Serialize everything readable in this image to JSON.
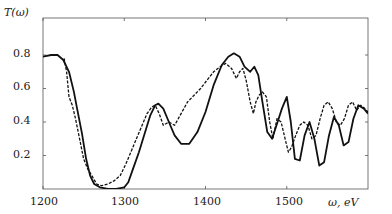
{
  "chart_data": {
    "type": "line",
    "title": "",
    "xlabel": "ω, eV",
    "ylabel": "T(ω)",
    "xlim": [
      1200,
      1600
    ],
    "ylim": [
      0,
      1.02
    ],
    "xticks": [
      1200,
      1300,
      1400,
      1500
    ],
    "yticks": [
      0.2,
      0.4,
      0.6,
      0.8
    ],
    "grid": false,
    "legend": null,
    "series": [
      {
        "name": "solid",
        "style": "solid",
        "x": [
          1200,
          1210,
          1218,
          1225,
          1232,
          1238,
          1242,
          1248,
          1253,
          1258,
          1263,
          1270,
          1280,
          1290,
          1300,
          1305,
          1310,
          1318,
          1325,
          1332,
          1338,
          1342,
          1348,
          1355,
          1362,
          1370,
          1380,
          1390,
          1400,
          1410,
          1420,
          1428,
          1435,
          1442,
          1448,
          1455,
          1460,
          1465,
          1470,
          1476,
          1482,
          1488,
          1494,
          1500,
          1505,
          1510,
          1516,
          1522,
          1528,
          1534,
          1540,
          1546,
          1552,
          1558,
          1564,
          1570,
          1576,
          1582,
          1588,
          1595,
          1600
        ],
        "y": [
          0.79,
          0.8,
          0.8,
          0.77,
          0.7,
          0.58,
          0.48,
          0.33,
          0.18,
          0.08,
          0.03,
          0.01,
          0.0,
          0.0,
          0.01,
          0.04,
          0.11,
          0.22,
          0.33,
          0.44,
          0.5,
          0.51,
          0.48,
          0.4,
          0.32,
          0.27,
          0.27,
          0.34,
          0.46,
          0.62,
          0.74,
          0.79,
          0.81,
          0.79,
          0.73,
          0.7,
          0.73,
          0.68,
          0.52,
          0.34,
          0.3,
          0.39,
          0.48,
          0.55,
          0.4,
          0.18,
          0.17,
          0.32,
          0.4,
          0.3,
          0.14,
          0.16,
          0.32,
          0.43,
          0.38,
          0.26,
          0.28,
          0.42,
          0.5,
          0.48,
          0.45
        ]
      },
      {
        "name": "dashed",
        "style": "dashed",
        "x": [
          1226,
          1229,
          1232,
          1236,
          1240,
          1245,
          1250,
          1255,
          1260,
          1266,
          1272,
          1280,
          1288,
          1295,
          1302,
          1308,
          1315,
          1322,
          1328,
          1334,
          1338,
          1343,
          1348,
          1355,
          1362,
          1370,
          1378,
          1386,
          1394,
          1402,
          1410,
          1418,
          1425,
          1432,
          1438,
          1442,
          1446,
          1450,
          1455,
          1459,
          1462,
          1466,
          1470,
          1475,
          1479,
          1483,
          1488,
          1493,
          1498,
          1502,
          1506,
          1511,
          1516,
          1521,
          1526,
          1531,
          1536,
          1541,
          1546,
          1551,
          1556,
          1561,
          1566,
          1571,
          1576,
          1581,
          1586,
          1591,
          1596,
          1600
        ],
        "y": [
          0.78,
          0.7,
          0.55,
          0.5,
          0.42,
          0.3,
          0.18,
          0.12,
          0.08,
          0.03,
          0.02,
          0.03,
          0.05,
          0.08,
          0.15,
          0.22,
          0.3,
          0.38,
          0.45,
          0.49,
          0.5,
          0.45,
          0.38,
          0.4,
          0.38,
          0.45,
          0.52,
          0.56,
          0.6,
          0.65,
          0.7,
          0.73,
          0.75,
          0.72,
          0.66,
          0.7,
          0.72,
          0.65,
          0.52,
          0.45,
          0.52,
          0.56,
          0.58,
          0.55,
          0.4,
          0.3,
          0.42,
          0.4,
          0.3,
          0.22,
          0.25,
          0.32,
          0.38,
          0.4,
          0.38,
          0.3,
          0.32,
          0.42,
          0.5,
          0.52,
          0.48,
          0.4,
          0.38,
          0.42,
          0.5,
          0.52,
          0.47,
          0.5,
          0.48,
          0.46
        ]
      }
    ]
  },
  "axes": {
    "ylabel": "T(ω)",
    "xlabel": "ω, eV",
    "xtick_labels": [
      "1200",
      "1300",
      "1400",
      "1500"
    ],
    "ytick_labels": [
      "0.2",
      "0.4",
      "0.6",
      "0.8"
    ]
  }
}
